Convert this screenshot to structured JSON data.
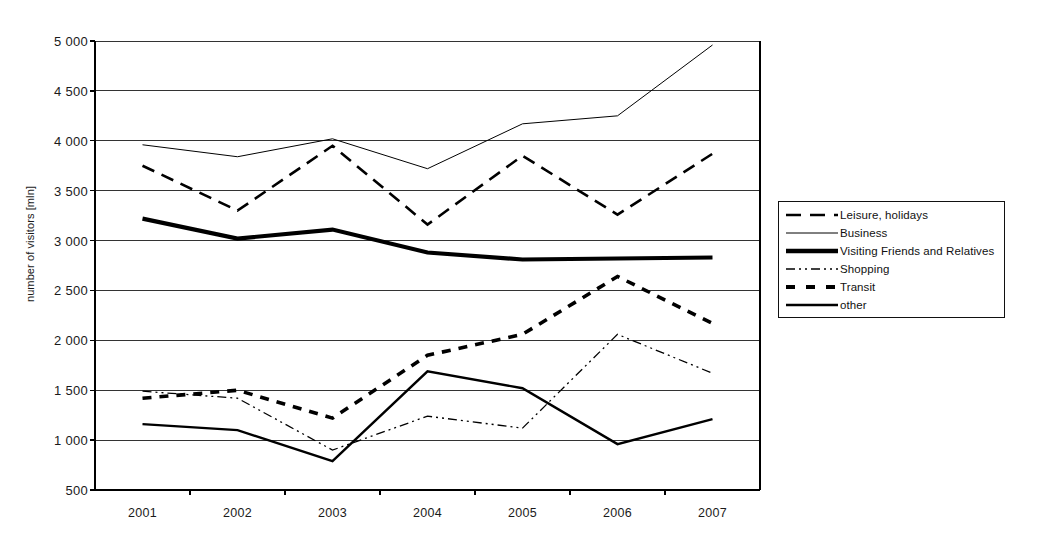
{
  "chart_data": {
    "type": "line",
    "title": "",
    "xlabel": "",
    "ylabel": "number of visitors [mln]",
    "categories": [
      "2001",
      "2002",
      "2003",
      "2004",
      "2005",
      "2006",
      "2007"
    ],
    "x": [
      2001,
      2002,
      2003,
      2004,
      2005,
      2006,
      2007
    ],
    "ylim": [
      500,
      5000
    ],
    "yticks": [
      "500",
      "1 000",
      "1 500",
      "2 000",
      "2 500",
      "3 000",
      "3 500",
      "4 000",
      "4 500",
      "5 000"
    ],
    "ytick_values": [
      500,
      1000,
      1500,
      2000,
      2500,
      3000,
      3500,
      4000,
      4500,
      5000
    ],
    "grid": true,
    "legend_position": "right",
    "series": [
      {
        "name": "Leisure, holidays",
        "style": "dashed",
        "width": 2.6,
        "color": "#000000",
        "values": [
          3750,
          3300,
          3950,
          3160,
          3850,
          3260,
          3870
        ]
      },
      {
        "name": "Business",
        "style": "solid",
        "width": 1.0,
        "color": "#000000",
        "values": [
          3960,
          3840,
          4020,
          3720,
          4170,
          4250,
          4960
        ]
      },
      {
        "name": "Visiting Friends and Relatives",
        "style": "solid",
        "width": 4.2,
        "color": "#000000",
        "values": [
          3220,
          3020,
          3110,
          2880,
          2810,
          2820,
          2830
        ]
      },
      {
        "name": "Shopping",
        "style": "dash-dot-dot",
        "width": 1.3,
        "color": "#000000",
        "values": [
          1490,
          1420,
          900,
          1240,
          1120,
          2060,
          1670
        ]
      },
      {
        "name": "Transit",
        "style": "thick-dashed",
        "width": 3.6,
        "color": "#000000",
        "values": [
          1420,
          1500,
          1220,
          1850,
          2060,
          2640,
          2170
        ]
      },
      {
        "name": "other",
        "style": "solid",
        "width": 2.4,
        "color": "#000000",
        "values": [
          1160,
          1100,
          790,
          1690,
          1520,
          960,
          1210
        ]
      }
    ]
  },
  "legend": {
    "items": [
      {
        "label": "Leisure, holidays",
        "swatch": "dashed-line-swatch"
      },
      {
        "label": "Business",
        "swatch": "thin-solid-line-swatch"
      },
      {
        "label": "Visiting Friends and Relatives",
        "swatch": "thick-solid-line-swatch"
      },
      {
        "label": "Shopping",
        "swatch": "dash-dot-dot-line-swatch"
      },
      {
        "label": "Transit",
        "swatch": "thick-dashed-line-swatch"
      },
      {
        "label": "other",
        "swatch": "medium-solid-line-swatch"
      }
    ]
  },
  "axes": {
    "y_title": "number of visitors [mln]"
  },
  "colors": {
    "ink": "#000000",
    "grid": "#333333",
    "background": "#ffffff"
  }
}
